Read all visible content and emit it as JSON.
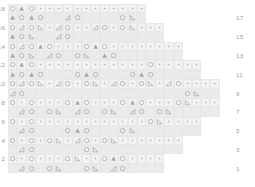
{
  "chart": {
    "title": "",
    "type": "knitting-stitch-chart",
    "total_rows": 18,
    "total_columns": 24,
    "cell_width": 9.2,
    "cell_height": 9.4,
    "colors": {
      "cell_background": "#f2f2f2",
      "cell_background_alt": "#ebebeb",
      "cell_border": "#e8e8e8",
      "symbol_outline": "#9d9d9d",
      "symbol_fill": "#a8a8a8",
      "row_number": "#9a9a9a",
      "page_background": "#ffffff"
    },
    "legend_symbols": {
      "o": "open-circle-yarn-over",
      "T": "filled-triangle-decrease",
      "L": "left-leaning-open-triangle",
      "R": "right-leaning-open-triangle",
      "d": "dot-knit-stitch",
      ".": "empty-no-stitch"
    },
    "row_numbers_left": [
      "18",
      "",
      "16",
      "",
      "14",
      "",
      "12",
      "",
      "10",
      "",
      "8",
      "",
      "6",
      "",
      "4",
      "",
      "2",
      ""
    ],
    "row_numbers_right": [
      "",
      "17",
      "",
      "15",
      "",
      "13",
      "",
      "11",
      "",
      "9",
      "",
      "7",
      "",
      "5",
      "",
      "3",
      "",
      "1"
    ],
    "rows": [
      {
        "number": "18",
        "side": "left",
        "label_left": "18",
        "label_right": "",
        "offset_cols": 9,
        "cells": [
          "o",
          "T",
          "o",
          "d",
          "d",
          "d",
          "d",
          "d",
          "d",
          "d",
          "d",
          "d",
          "d",
          "d",
          "d"
        ]
      },
      {
        "number": "17",
        "side": "right",
        "label_left": "",
        "label_right": "17",
        "offset_cols": 9,
        "cells": [
          "T",
          "o",
          "T",
          "o",
          ".",
          ".",
          "L",
          "o",
          ".",
          ".",
          ".",
          ".",
          "o",
          "R",
          "."
        ]
      },
      {
        "number": "16",
        "side": "left",
        "label_left": "16",
        "label_right": "",
        "offset_cols": 7,
        "cells": [
          "o",
          "L",
          "o",
          "R",
          "d",
          "L",
          "o",
          "d",
          "d",
          "L",
          "o",
          "d",
          "o",
          "R",
          "d",
          "d",
          "d"
        ]
      },
      {
        "number": "15",
        "side": "right",
        "label_left": "",
        "label_right": "15",
        "offset_cols": 7,
        "cells": [
          "T",
          "o",
          "R",
          ".",
          ".",
          "L",
          "o",
          ".",
          ".",
          ".",
          ".",
          ".",
          ".",
          ".",
          ".",
          ".",
          "."
        ]
      },
      {
        "number": "14",
        "side": "left",
        "label_left": "14",
        "label_right": "",
        "offset_cols": 5,
        "cells": [
          "o",
          "L",
          "o",
          "T",
          "o",
          "d",
          "d",
          "d",
          "o",
          "T",
          "o",
          "d",
          "d",
          "d",
          "d",
          "d",
          "d",
          "d",
          "d"
        ]
      },
      {
        "number": "13",
        "side": "right",
        "label_left": "",
        "label_right": "13",
        "offset_cols": 5,
        "cells": [
          "T",
          "o",
          "R",
          ".",
          "L",
          "o",
          ".",
          "o",
          "R",
          ".",
          "T",
          "o",
          ".",
          ".",
          ".",
          ".",
          ".",
          ".",
          "."
        ]
      },
      {
        "number": "12",
        "side": "left",
        "label_left": "12",
        "label_right": "",
        "offset_cols": 3,
        "cells": [
          "o",
          "T",
          "o",
          "d",
          "d",
          "d",
          "d",
          "d",
          "d",
          "d",
          "d",
          "d",
          "d",
          "d",
          "d",
          "o",
          "d",
          "d",
          "d",
          "d",
          "d"
        ]
      },
      {
        "number": "11",
        "side": "right",
        "label_left": "",
        "label_right": "11",
        "offset_cols": 3,
        "cells": [
          "T",
          "o",
          "T",
          "o",
          ".",
          ".",
          ".",
          "o",
          "T",
          "o",
          ".",
          ".",
          ".",
          "o",
          "T",
          "o",
          ".",
          ".",
          ".",
          ".",
          "."
        ]
      },
      {
        "number": "10",
        "side": "left",
        "label_left": "10",
        "label_right": "",
        "offset_cols": 1,
        "cells": [
          "o",
          "L",
          "o",
          "R",
          "d",
          "L",
          "o",
          "d",
          "o",
          "R",
          "d",
          "L",
          "o",
          "d",
          "o",
          "R",
          "d",
          "L",
          "o",
          "d",
          "d",
          "d",
          "d"
        ]
      },
      {
        "number": "9",
        "side": "right",
        "label_left": "",
        "label_right": "9",
        "offset_cols": 1,
        "cells": [
          "L",
          "o",
          ".",
          ".",
          ".",
          ".",
          ".",
          ".",
          ".",
          ".",
          ".",
          ".",
          ".",
          ".",
          ".",
          ".",
          ".",
          ".",
          ".",
          "o",
          "R",
          ".",
          "."
        ]
      },
      {
        "number": "8",
        "side": "left",
        "label_left": "8",
        "label_right": "",
        "offset_cols": 1,
        "cells": [
          "o",
          "d",
          "o",
          "d",
          "d",
          "d",
          "o",
          "T",
          "o",
          "d",
          "d",
          "d",
          "o",
          "T",
          "o",
          "d",
          "d",
          "d",
          "o",
          "R",
          "d",
          "d",
          "d"
        ]
      },
      {
        "number": "7",
        "side": "right",
        "label_left": "",
        "label_right": "7",
        "offset_cols": 1,
        "cells": [
          ".",
          "L",
          "o",
          ".",
          "o",
          "R",
          ".",
          "L",
          "o",
          ".",
          "o",
          "R",
          ".",
          "L",
          "o",
          ".",
          "o",
          "R",
          ".",
          ".",
          ".",
          ".",
          "."
        ]
      },
      {
        "number": "6",
        "side": "left",
        "label_left": "6",
        "label_right": "",
        "offset_cols": 3,
        "cells": [
          "o",
          "d",
          "o",
          "d",
          "d",
          "d",
          "d",
          "d",
          "d",
          "d",
          "d",
          "d",
          "d",
          "d",
          "d",
          "o",
          "R",
          "d",
          "d",
          "d",
          "d"
        ]
      },
      {
        "number": "5",
        "side": "right",
        "label_left": "",
        "label_right": "5",
        "offset_cols": 3,
        "cells": [
          ".",
          "L",
          "o",
          ".",
          ".",
          ".",
          "o",
          "T",
          "o",
          ".",
          ".",
          ".",
          "o",
          "R",
          ".",
          ".",
          ".",
          ".",
          ".",
          ".",
          "."
        ]
      },
      {
        "number": "4",
        "side": "left",
        "label_left": "4",
        "label_right": "",
        "offset_cols": 5,
        "cells": [
          "o",
          "d",
          "o",
          "d",
          "o",
          "R",
          "d",
          "L",
          "o",
          "d",
          "o",
          "R",
          "d",
          "d",
          "d",
          "d",
          "d",
          "d",
          "d"
        ]
      },
      {
        "number": "3",
        "side": "right",
        "label_left": "",
        "label_right": "3",
        "offset_cols": 5,
        "cells": [
          ".",
          "L",
          "o",
          ".",
          ".",
          ".",
          ".",
          ".",
          "o",
          "R",
          ".",
          ".",
          ".",
          ".",
          ".",
          ".",
          ".",
          ".",
          "."
        ]
      },
      {
        "number": "2",
        "side": "left",
        "label_left": "2",
        "label_right": "",
        "offset_cols": 7,
        "cells": [
          "o",
          "d",
          "o",
          "d",
          "d",
          "d",
          "o",
          "R",
          "d",
          "d",
          "o",
          "T",
          "o",
          "d",
          "d",
          "d",
          "d"
        ]
      },
      {
        "number": "1",
        "side": "right",
        "label_left": "",
        "label_right": "1",
        "offset_cols": 7,
        "cells": [
          ".",
          "L",
          "o",
          ".",
          "o",
          "R",
          ".",
          ".",
          "o",
          "R",
          ".",
          "L",
          "o",
          ".",
          ".",
          ".",
          "."
        ]
      }
    ]
  }
}
